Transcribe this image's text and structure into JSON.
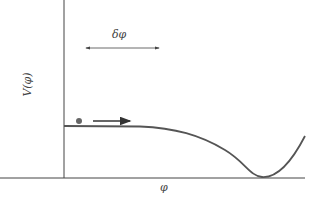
{
  "diagram": {
    "ylabel": "V(φ)",
    "xlabel": "φ",
    "displacement_label": "δφ",
    "colors": {
      "axis": "#444444",
      "curve": "#555555",
      "ball": "#666666",
      "arrow": "#333333"
    }
  }
}
